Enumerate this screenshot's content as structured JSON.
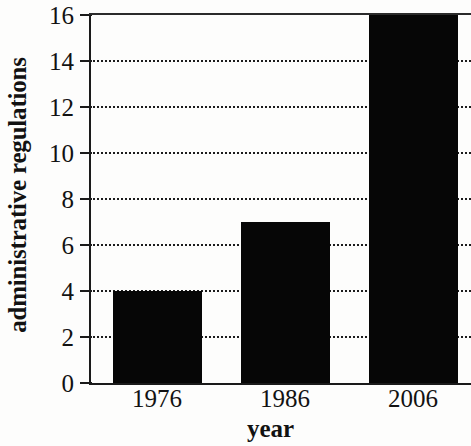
{
  "chart_data": {
    "type": "bar",
    "title": "",
    "categories": [
      "1976",
      "1986",
      "2006"
    ],
    "values": [
      4,
      7,
      16
    ],
    "series": [
      {
        "name": "administrative regulations",
        "values": [
          4,
          7,
          16
        ]
      }
    ],
    "xlabel": "year",
    "ylabel": "administrative regulations",
    "ylim": [
      0,
      16
    ],
    "yticks": [
      0,
      2,
      4,
      6,
      8,
      10,
      12,
      14,
      16
    ],
    "ytick_labels": [
      "0",
      "2",
      "4",
      "6",
      "8",
      "10",
      "12",
      "14",
      "16"
    ],
    "grid": true,
    "grid_axis": "y",
    "grid_style": "dotted",
    "legend": false,
    "legend_position": "none",
    "bar_color": "#060606",
    "axis_color": "#1a1a1a",
    "text_color": "#121212",
    "background_color": "#fdfdfc"
  },
  "axes": {
    "y_title": "administrative regulations",
    "x_title": "year"
  }
}
